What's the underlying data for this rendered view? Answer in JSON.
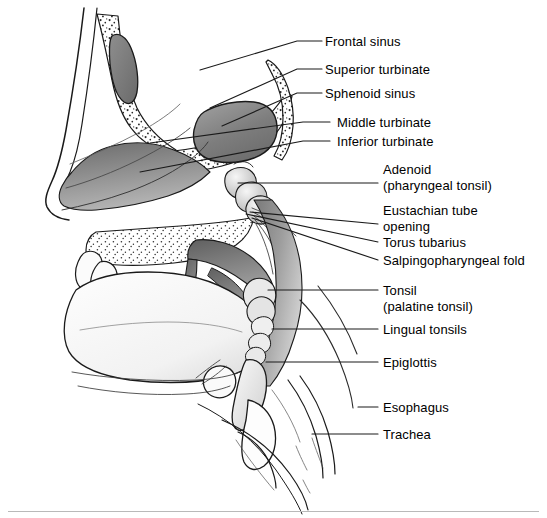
{
  "figure": {
    "ink_color": "#1a1a1a",
    "tissue_gray_dark": "#6f6f6f",
    "tissue_gray_mid": "#9a9a9a",
    "tissue_gray_light": "#c8c8c8",
    "background": "#ffffff",
    "rule_color": "#b9b9b9"
  },
  "labels": [
    {
      "id": "frontal-sinus",
      "line1": "Frontal sinus",
      "line2": "",
      "text_x": 325,
      "text_y": 34,
      "leader": {
        "x1": 297,
        "y1": 41,
        "x2": 322,
        "y2": 41,
        "bend_x": 200,
        "bend_y": 70
      }
    },
    {
      "id": "superior-turbinate",
      "line1": "Superior turbinate",
      "line2": "",
      "text_x": 325,
      "text_y": 62,
      "leader": {
        "x1": 297,
        "y1": 69,
        "x2": 322,
        "y2": 69,
        "bend_x": 210,
        "bend_y": 108
      }
    },
    {
      "id": "sphenoid-sinus",
      "line1": "Sphenoid sinus",
      "line2": "",
      "text_x": 325,
      "text_y": 86,
      "leader": {
        "x1": 297,
        "y1": 93,
        "x2": 322,
        "y2": 93,
        "bend_x": 222,
        "bend_y": 126
      }
    },
    {
      "id": "middle-turbinate",
      "line1": "Middle turbinate",
      "line2": "",
      "text_x": 337,
      "text_y": 115,
      "leader": {
        "x1": 303,
        "y1": 122,
        "x2": 330,
        "y2": 122,
        "bend_x": 150,
        "bend_y": 143
      }
    },
    {
      "id": "inferior-turbinate",
      "line1": "Inferior turbinate",
      "line2": "",
      "text_x": 337,
      "text_y": 134,
      "leader": {
        "x1": 303,
        "y1": 141,
        "x2": 330,
        "y2": 141,
        "bend_x": 140,
        "bend_y": 172
      }
    },
    {
      "id": "adenoid",
      "line1": "Adenoid",
      "line2": "(pharyngeal tonsil)",
      "text_x": 383,
      "text_y": 162,
      "leader": {
        "x1": 238,
        "y1": 183,
        "x2": 378,
        "y2": 183,
        "bend_x": 238,
        "bend_y": 183
      }
    },
    {
      "id": "eustachian-tube",
      "line1": "Eustachian tube",
      "line2": "opening",
      "text_x": 383,
      "text_y": 203,
      "leader": {
        "x1": 250,
        "y1": 212,
        "x2": 378,
        "y2": 224,
        "bend_x": 250,
        "bend_y": 212
      }
    },
    {
      "id": "torus-tubarius",
      "line1": "Torus tubarius",
      "line2": "",
      "text_x": 383,
      "text_y": 235,
      "leader": {
        "x1": 246,
        "y1": 214,
        "x2": 378,
        "y2": 242,
        "bend_x": 246,
        "bend_y": 214
      }
    },
    {
      "id": "salpingopharyngeal-fold",
      "line1": "Salpingopharyngeal fold",
      "line2": "",
      "text_x": 383,
      "text_y": 253,
      "leader": {
        "x1": 252,
        "y1": 218,
        "x2": 378,
        "y2": 260,
        "bend_x": 252,
        "bend_y": 218
      }
    },
    {
      "id": "tonsil",
      "line1": "Tonsil",
      "line2": "(palatine tonsil)",
      "text_x": 383,
      "text_y": 283,
      "leader": {
        "x1": 268,
        "y1": 290,
        "x2": 378,
        "y2": 290,
        "bend_x": 268,
        "bend_y": 290
      }
    },
    {
      "id": "lingual-tonsils",
      "line1": "Lingual tonsils",
      "line2": "",
      "text_x": 383,
      "text_y": 322,
      "leader": {
        "x1": 272,
        "y1": 329,
        "x2": 378,
        "y2": 329,
        "bend_x": 272,
        "bend_y": 329
      }
    },
    {
      "id": "epiglottis",
      "line1": "Epiglottis",
      "line2": "",
      "text_x": 383,
      "text_y": 355,
      "leader": {
        "x1": 266,
        "y1": 362,
        "x2": 378,
        "y2": 362,
        "bend_x": 266,
        "bend_y": 362
      }
    },
    {
      "id": "esophagus",
      "line1": "Esophagus",
      "line2": "",
      "text_x": 383,
      "text_y": 400,
      "leader": {
        "x1": 358,
        "y1": 407,
        "x2": 378,
        "y2": 407,
        "bend_x": 358,
        "bend_y": 407
      }
    },
    {
      "id": "trachea",
      "line1": "Trachea",
      "line2": "",
      "text_x": 383,
      "text_y": 427,
      "leader": {
        "x1": 312,
        "y1": 434,
        "x2": 378,
        "y2": 434,
        "bend_x": 312,
        "bend_y": 434
      }
    }
  ]
}
